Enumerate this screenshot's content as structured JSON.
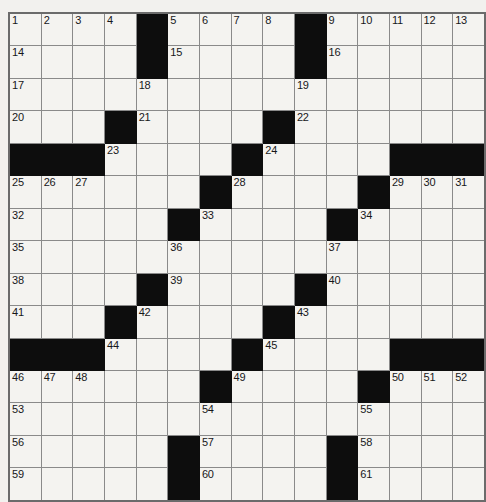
{
  "puzzle": {
    "kind": "crossword-grid",
    "title": "",
    "rows": 15,
    "columns": 15,
    "colors": {
      "paper": "#f2f1ee",
      "cell_fill": "#f4f3f0",
      "block_fill": "#0d0d0d",
      "cell_border": "#8a8a8a",
      "outer_border": "#6b6b6b",
      "number_text": "#17171a"
    },
    "highest_clue_number": 61,
    "blocks": [
      [
        0,
        4
      ],
      [
        0,
        9
      ],
      [
        1,
        4
      ],
      [
        1,
        9
      ],
      [
        3,
        3
      ],
      [
        3,
        8
      ],
      [
        4,
        0
      ],
      [
        4,
        1
      ],
      [
        4,
        2
      ],
      [
        4,
        7
      ],
      [
        4,
        12
      ],
      [
        4,
        13
      ],
      [
        4,
        14
      ],
      [
        5,
        6
      ],
      [
        5,
        11
      ],
      [
        6,
        5
      ],
      [
        6,
        10
      ],
      [
        8,
        4
      ],
      [
        8,
        9
      ],
      [
        9,
        3
      ],
      [
        9,
        8
      ],
      [
        10,
        0
      ],
      [
        10,
        1
      ],
      [
        10,
        2
      ],
      [
        10,
        7
      ],
      [
        10,
        12
      ],
      [
        10,
        13
      ],
      [
        10,
        14
      ],
      [
        11,
        6
      ],
      [
        11,
        11
      ],
      [
        13,
        5
      ],
      [
        13,
        10
      ],
      [
        14,
        5
      ],
      [
        14,
        10
      ]
    ],
    "numbers": {
      "0": {
        "0": "1",
        "1": "2",
        "2": "3",
        "3": "4",
        "5": "5",
        "6": "6",
        "7": "7",
        "8": "8",
        "10": "9",
        "11": "10",
        "12": "11",
        "13": "12",
        "14": "13"
      },
      "1": {
        "0": "14",
        "5": "15",
        "10": "16"
      },
      "2": {
        "0": "17",
        "4": "18",
        "9": "19"
      },
      "3": {
        "0": "20",
        "4": "21",
        "9": "22"
      },
      "4": {
        "3": "23",
        "8": "24"
      },
      "5": {
        "0": "25",
        "1": "26",
        "2": "27",
        "7": "28",
        "12": "29",
        "13": "30",
        "14": "31"
      },
      "6": {
        "0": "32",
        "6": "33",
        "11": "34"
      },
      "7": {
        "0": "35",
        "5": "36",
        "10": "37"
      },
      "8": {
        "0": "38",
        "5": "39",
        "10": "40"
      },
      "9": {
        "0": "41",
        "4": "42",
        "9": "43"
      },
      "10": {
        "3": "44",
        "8": "45"
      },
      "11": {
        "0": "46",
        "1": "47",
        "2": "48",
        "7": "49",
        "12": "50",
        "13": "51",
        "14": "52"
      },
      "12": {
        "0": "53",
        "6": "54",
        "11": "55"
      },
      "13": {
        "0": "56",
        "6": "57",
        "11": "58"
      },
      "14": {
        "0": "59",
        "6": "60",
        "11": "61"
      }
    },
    "letters": {}
  }
}
